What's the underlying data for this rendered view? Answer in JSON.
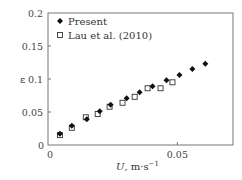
{
  "chart_data": {
    "type": "scatter",
    "title": "",
    "xlabel": "U, m·s⁻¹",
    "xlabel_italic_part": "U",
    "xlabel_rest": ", m·s",
    "xlabel_sup": "−1",
    "ylabel": "ε",
    "xlim": [
      0,
      0.0715
    ],
    "ylim": [
      0,
      0.2
    ],
    "xticks": [
      0,
      0.05
    ],
    "xtick_labels": [
      "0",
      "0.05"
    ],
    "yticks": [
      0,
      0.05,
      0.1,
      0.15,
      0.2
    ],
    "ytick_labels": [
      "0",
      "0.05",
      "0.1",
      "0.15",
      "0.2"
    ],
    "grid": false,
    "legend_position": "upper-left",
    "series": [
      {
        "name": "Present",
        "marker": "filled-diamond",
        "color": "#111111",
        "x": [
          0.0046,
          0.0092,
          0.015,
          0.02,
          0.0242,
          0.0304,
          0.0354,
          0.0404,
          0.0458,
          0.0508,
          0.0558,
          0.0608
        ],
        "y": [
          0.017,
          0.029,
          0.039,
          0.051,
          0.061,
          0.071,
          0.08,
          0.089,
          0.098,
          0.106,
          0.115,
          0.123
        ]
      },
      {
        "name": "Lau et al. (2010)",
        "marker": "open-square",
        "color": "#333333",
        "x": [
          0.0046,
          0.0092,
          0.0146,
          0.0192,
          0.0238,
          0.0288,
          0.0335,
          0.0385,
          0.0435,
          0.0481
        ],
        "y": [
          0.015,
          0.026,
          0.042,
          0.047,
          0.058,
          0.064,
          0.073,
          0.086,
          0.086,
          0.095
        ]
      }
    ]
  },
  "plot": {
    "left": 48,
    "top": 13,
    "right": 233,
    "bottom": 145
  },
  "legend": {
    "items": [
      {
        "label": "Present",
        "marker": "filled-diamond"
      },
      {
        "label": "Lau et al. (2010)",
        "marker": "open-square"
      }
    ]
  },
  "axes": {
    "y_symbol": "ε",
    "x_zero_label": "0",
    "y_zero_label": "0"
  }
}
